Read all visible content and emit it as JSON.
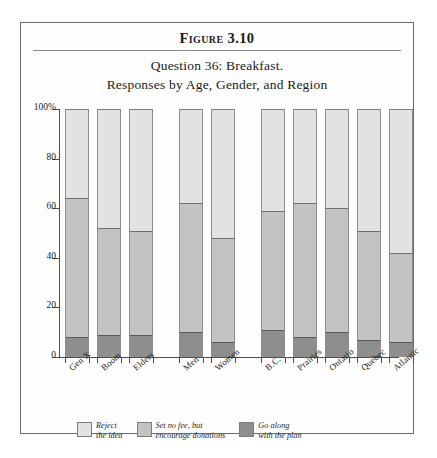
{
  "figure": {
    "label": "Figure 3.10",
    "subtitle_line1": "Question 36: Breakfast.",
    "subtitle_line2": "Responses by Age, Gender, and Region"
  },
  "colors": {
    "reject": "#e2e2e0",
    "set_no_fee": "#c3c3c1",
    "go_along": "#8e8e8c",
    "axis": "#4d4d4d",
    "frame": "#6b6b6b"
  },
  "legend": {
    "items": [
      {
        "key": "reject",
        "line1": "Reject",
        "line2": "the idea",
        "color": "#e2e2e0"
      },
      {
        "key": "set_no_fee",
        "line1": "Set no fee, but",
        "line2": "encourage donations",
        "color": "#c3c3c1"
      },
      {
        "key": "go_along",
        "line1": "Go along",
        "line2": "with the plan",
        "color": "#8e8e8c"
      }
    ]
  },
  "chart_data": {
    "type": "bar",
    "stacked": true,
    "title": "Question 36: Breakfast. Responses by Age, Gender, and Region",
    "xlabel": "",
    "ylabel": "",
    "ylim": [
      0,
      100
    ],
    "yticks": [
      0,
      20,
      40,
      60,
      80,
      100
    ],
    "ytick_labels": [
      "0",
      "20",
      "40",
      "60",
      "80",
      "100%"
    ],
    "grid": false,
    "legend_position": "bottom",
    "categories": [
      "Gen X",
      "Boom",
      "Elders",
      "Men",
      "Women",
      "B.C.",
      "Prairies",
      "Ontario",
      "Quebec",
      "Atlantic"
    ],
    "groups": [
      {
        "name": "Age",
        "categories": [
          "Gen X",
          "Boom",
          "Elders"
        ]
      },
      {
        "name": "Gender",
        "categories": [
          "Men",
          "Women"
        ]
      },
      {
        "name": "Region",
        "categories": [
          "B.C.",
          "Prairies",
          "Ontario",
          "Quebec",
          "Atlantic"
        ]
      }
    ],
    "series": [
      {
        "name": "Go along with the plan",
        "color": "#8e8e8c",
        "values": [
          8,
          9,
          9,
          10,
          6,
          11,
          8,
          10,
          7,
          6
        ]
      },
      {
        "name": "Set no fee, but encourage donations",
        "color": "#c3c3c1",
        "values": [
          56,
          43,
          42,
          52,
          42,
          48,
          54,
          50,
          44,
          36
        ]
      },
      {
        "name": "Reject the idea",
        "color": "#e2e2e0",
        "values": [
          36,
          48,
          49,
          38,
          52,
          41,
          38,
          40,
          49,
          58
        ]
      }
    ],
    "cumulative_tops": {
      "go_along": [
        8,
        9,
        9,
        10,
        6,
        11,
        8,
        10,
        7,
        6
      ],
      "set_no_fee": [
        64,
        52,
        51,
        62,
        48,
        59,
        62,
        60,
        51,
        42
      ]
    }
  }
}
